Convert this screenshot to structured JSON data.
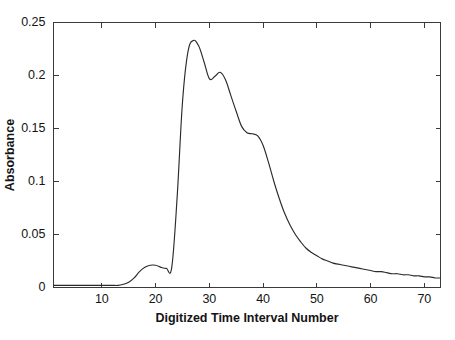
{
  "chart_data": {
    "type": "line",
    "title": "",
    "xlabel": "Digitized Time Interval Number",
    "ylabel": "Absorbance",
    "xlim": [
      1,
      73
    ],
    "ylim": [
      0,
      0.25
    ],
    "grid": false,
    "legend": null,
    "xticks": [
      10,
      20,
      30,
      40,
      50,
      60,
      70
    ],
    "yticks": [
      0,
      0.05,
      0.1,
      0.15,
      0.2,
      0.25
    ],
    "xtick_labels": [
      "10",
      "20",
      "30",
      "40",
      "50",
      "60",
      "70"
    ],
    "ytick_labels": [
      "0",
      "0.05",
      "0.1",
      "0.15",
      "0.2",
      "0.25"
    ],
    "series": [
      {
        "name": "Absorbance trace",
        "color": "#2b2b2b",
        "x": [
          1,
          2,
          3,
          4,
          5,
          6,
          7,
          8,
          9,
          10,
          11,
          12,
          13,
          14,
          15,
          16,
          17,
          18,
          19,
          20,
          21,
          22,
          23,
          24,
          25,
          26,
          27,
          28,
          29,
          30,
          31,
          32,
          33,
          34,
          35,
          36,
          37,
          38,
          39,
          40,
          41,
          42,
          43,
          44,
          45,
          46,
          47,
          48,
          49,
          50,
          51,
          52,
          53,
          54,
          55,
          56,
          57,
          58,
          59,
          60,
          61,
          62,
          63,
          64,
          65,
          66,
          67,
          68,
          69,
          70,
          71,
          72,
          73
        ],
        "values": [
          0.002,
          0.002,
          0.002,
          0.002,
          0.002,
          0.002,
          0.002,
          0.002,
          0.002,
          0.002,
          0.002,
          0.002,
          0.002,
          0.003,
          0.005,
          0.009,
          0.015,
          0.019,
          0.021,
          0.021,
          0.019,
          0.018,
          0.019,
          0.085,
          0.175,
          0.222,
          0.233,
          0.228,
          0.213,
          0.197,
          0.199,
          0.203,
          0.196,
          0.181,
          0.166,
          0.152,
          0.146,
          0.145,
          0.143,
          0.134,
          0.118,
          0.1,
          0.084,
          0.07,
          0.059,
          0.05,
          0.043,
          0.037,
          0.033,
          0.03,
          0.027,
          0.025,
          0.023,
          0.022,
          0.021,
          0.02,
          0.019,
          0.018,
          0.017,
          0.016,
          0.015,
          0.015,
          0.014,
          0.013,
          0.013,
          0.012,
          0.012,
          0.011,
          0.011,
          0.01,
          0.01,
          0.009,
          0.009
        ]
      }
    ]
  }
}
